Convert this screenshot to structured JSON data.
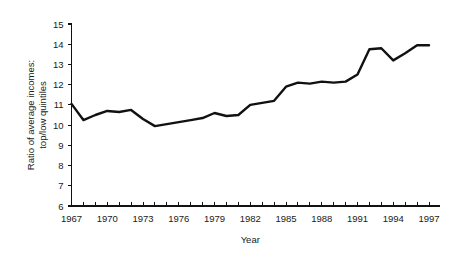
{
  "chart_data": {
    "type": "line",
    "title": "",
    "xlabel": "Year",
    "ylabel": "Ratio of average incomes: top/low quintiles",
    "ylabel_line1": "Ratio of average incomes:",
    "ylabel_line2": "top/low quintiles",
    "xlim": [
      1967,
      1997
    ],
    "ylim": [
      6,
      15
    ],
    "grid": false,
    "legend": "none",
    "line_color": "#111111",
    "x_tick_labels": [
      "1967",
      "1970",
      "1973",
      "1976",
      "1979",
      "1982",
      "1985",
      "1988",
      "1991",
      "1994",
      "1997"
    ],
    "x_tick_label_values": [
      1967,
      1970,
      1973,
      1976,
      1979,
      1982,
      1985,
      1988,
      1991,
      1994,
      1997
    ],
    "x_minor_ticks": [
      1967,
      1968,
      1969,
      1970,
      1971,
      1972,
      1973,
      1974,
      1975,
      1976,
      1977,
      1978,
      1979,
      1980,
      1981,
      1982,
      1983,
      1984,
      1985,
      1986,
      1987,
      1988,
      1989,
      1990,
      1991,
      1992,
      1993,
      1994,
      1995,
      1996,
      1997
    ],
    "y_tick_labels": [
      "15",
      "14",
      "13",
      "12",
      "11",
      "10",
      "9",
      "8",
      "7",
      "6"
    ],
    "y_tick_values": [
      15,
      14,
      13,
      12,
      11,
      10,
      9,
      8,
      7,
      6
    ],
    "x": [
      1967,
      1968,
      1969,
      1970,
      1971,
      1972,
      1973,
      1974,
      1975,
      1976,
      1977,
      1978,
      1979,
      1980,
      1981,
      1982,
      1983,
      1984,
      1985,
      1986,
      1987,
      1988,
      1989,
      1990,
      1991,
      1992,
      1993,
      1994,
      1995,
      1996,
      1997
    ],
    "values": [
      11.05,
      10.25,
      10.5,
      10.7,
      10.65,
      10.75,
      10.3,
      9.95,
      10.05,
      10.15,
      10.25,
      10.35,
      10.6,
      10.45,
      10.5,
      11.0,
      11.1,
      11.2,
      11.9,
      12.1,
      12.05,
      12.15,
      12.1,
      12.15,
      12.5,
      13.75,
      13.8,
      13.2,
      13.55,
      13.95,
      13.95
    ],
    "series": [
      {
        "name": "Ratio of average incomes: top/low quintiles",
        "values": [
          11.05,
          10.25,
          10.5,
          10.7,
          10.65,
          10.75,
          10.3,
          9.95,
          10.05,
          10.15,
          10.25,
          10.35,
          10.6,
          10.45,
          10.5,
          11.0,
          11.1,
          11.2,
          11.9,
          12.1,
          12.05,
          12.15,
          12.1,
          12.15,
          12.5,
          13.75,
          13.8,
          13.2,
          13.55,
          13.95,
          13.95
        ]
      }
    ]
  }
}
